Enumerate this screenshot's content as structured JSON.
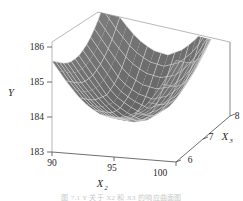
{
  "figure": {
    "caption": "图 7.1 Y 关于 X2 和 X3 的响应曲面图"
  },
  "chart_data": {
    "type": "surface",
    "title": "",
    "projection": "3d",
    "grid": true,
    "legend": null,
    "surface_color": "#6d6d6d",
    "mesh_color": "#d8d8d8",
    "axis_color": "#8a8a8a",
    "zaxis": {
      "label": "Y",
      "ticks": [
        183,
        184,
        185,
        186
      ],
      "tick_labels": [
        "183",
        "184",
        "185",
        "186"
      ],
      "range": [
        183,
        186
      ]
    },
    "xaxis": {
      "label": "X",
      "sub": "2",
      "ticks": [
        90,
        95,
        100
      ],
      "tick_labels": [
        "90",
        "95",
        "100"
      ],
      "range": [
        90,
        100
      ]
    },
    "yaxis": {
      "label": "X",
      "sub": "3",
      "ticks": [
        6,
        7,
        8
      ],
      "tick_labels": [
        "6",
        "7",
        "8"
      ],
      "range": [
        6,
        8
      ]
    },
    "z_values": [
      [
        185.6,
        185.0,
        184.5,
        184.2,
        184.1,
        184.2,
        184.5,
        185.1,
        185.9
      ],
      [
        185.4,
        184.8,
        184.3,
        184.0,
        183.9,
        184.0,
        184.3,
        184.9,
        185.7
      ],
      [
        185.2,
        184.6,
        184.1,
        183.8,
        183.7,
        183.8,
        184.1,
        184.7,
        185.5
      ],
      [
        185.1,
        184.5,
        184.0,
        183.6,
        183.5,
        183.6,
        184.0,
        184.6,
        185.4
      ],
      [
        185.1,
        184.5,
        183.9,
        183.6,
        183.4,
        183.6,
        183.9,
        184.6,
        185.4
      ],
      [
        185.2,
        184.6,
        184.0,
        183.7,
        183.5,
        183.7,
        184.0,
        184.7,
        185.6
      ],
      [
        185.4,
        184.8,
        184.2,
        183.9,
        183.8,
        183.9,
        184.3,
        185.0,
        185.9
      ],
      [
        185.7,
        185.1,
        184.6,
        184.3,
        184.2,
        184.3,
        184.7,
        185.4,
        186.3
      ],
      [
        186.1,
        185.5,
        185.0,
        184.7,
        184.6,
        184.8,
        185.2,
        185.9,
        186.8
      ]
    ]
  }
}
